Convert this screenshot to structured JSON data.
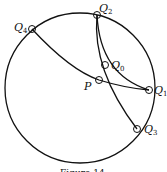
{
  "labels": {
    "q0": "Q",
    "q0_sub": "0",
    "q1": "Q",
    "q1_sub": "1",
    "q2": "Q",
    "q2_sub": "2",
    "q3": "Q",
    "q3_sub": "3",
    "q4": "Q",
    "q4_sub": "4",
    "p": "P"
  },
  "caption": "Figure 14",
  "stroke_color": "#111111"
}
